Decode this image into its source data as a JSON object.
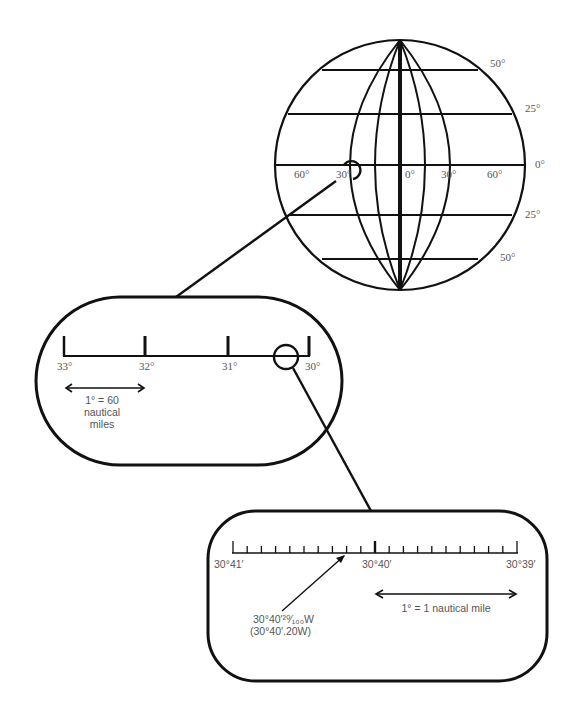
{
  "globe": {
    "latitude_labels": [
      "50°",
      "25°",
      "0°",
      "25°",
      "50°"
    ],
    "longitude_labels": [
      "60°",
      "30°",
      "0°",
      "30°",
      "60°"
    ]
  },
  "panel_degrees": {
    "tick_labels": [
      "33°",
      "32°",
      "31°",
      "30°"
    ],
    "scale_line1": "1° = 60",
    "scale_line2": "nautical",
    "scale_line3": "miles"
  },
  "panel_minutes": {
    "tick_labels": [
      "30°41′",
      "30°40′",
      "30°39′"
    ],
    "scale_note": "1° = 1 nautical mile",
    "callout_line1": "30°40′²⁰⁄₁₀₀W",
    "callout_line2": "(30°40′.20W)"
  },
  "colors": {
    "stroke": "#111111",
    "label": "#555555"
  }
}
